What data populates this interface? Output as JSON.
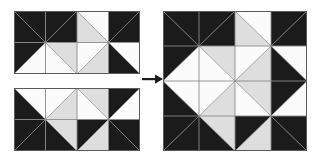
{
  "figure": {
    "background_color": "#ffffff"
  },
  "palette": {
    "dark": "#1b1b1b",
    "white": "#fbfbfb",
    "light_gray": "#dedede",
    "seam_line": "#8a8a8a",
    "border": "#5a5a5a",
    "arrow": "#1b1b1b"
  },
  "arrow": {
    "name": "transformation-arrow",
    "direction": "right",
    "label": ""
  },
  "blocks": [
    {
      "id": "top-left-unit",
      "name": "quilt-unit-top",
      "label": "",
      "x": 14,
      "y": 11,
      "width": 126,
      "height": 63,
      "cols": 4,
      "rows": 2,
      "cells": [
        {
          "r": 0,
          "c": 0,
          "diag": "tlbr",
          "a": "dark",
          "b": "dark"
        },
        {
          "r": 0,
          "c": 1,
          "diag": "trbl",
          "a": "dark",
          "b": "dark"
        },
        {
          "r": 0,
          "c": 2,
          "diag": "tlbr",
          "a": "white",
          "b": "light_gray"
        },
        {
          "r": 0,
          "c": 3,
          "diag": "trbl",
          "a": "dark",
          "b": "dark"
        },
        {
          "r": 1,
          "c": 0,
          "diag": "trbl",
          "a": "dark",
          "b": "white"
        },
        {
          "r": 1,
          "c": 1,
          "diag": "tlbr",
          "a": "light_gray",
          "b": "white"
        },
        {
          "r": 1,
          "c": 2,
          "diag": "trbl",
          "a": "white",
          "b": "light_gray"
        },
        {
          "r": 1,
          "c": 3,
          "diag": "tlbr",
          "a": "white",
          "b": "dark"
        }
      ]
    },
    {
      "id": "bottom-left-unit",
      "name": "quilt-unit-bottom",
      "label": "",
      "x": 14,
      "y": 88,
      "width": 126,
      "height": 63,
      "cols": 4,
      "rows": 2,
      "cells": [
        {
          "r": 0,
          "c": 0,
          "diag": "tlbr",
          "a": "white",
          "b": "dark"
        },
        {
          "r": 0,
          "c": 1,
          "diag": "trbl",
          "a": "white",
          "b": "light_gray"
        },
        {
          "r": 0,
          "c": 2,
          "diag": "tlbr",
          "a": "light_gray",
          "b": "white"
        },
        {
          "r": 0,
          "c": 3,
          "diag": "trbl",
          "a": "dark",
          "b": "white"
        },
        {
          "r": 1,
          "c": 0,
          "diag": "trbl",
          "a": "dark",
          "b": "dark"
        },
        {
          "r": 1,
          "c": 1,
          "diag": "tlbr",
          "a": "light_gray",
          "b": "dark"
        },
        {
          "r": 1,
          "c": 2,
          "diag": "trbl",
          "a": "dark",
          "b": "light_gray"
        },
        {
          "r": 1,
          "c": 3,
          "diag": "tlbr",
          "a": "dark",
          "b": "dark"
        }
      ]
    },
    {
      "id": "result-block",
      "name": "quilt-block-assembled",
      "label": "",
      "x": 163,
      "y": 11,
      "width": 144,
      "height": 140,
      "cols": 4,
      "rows": 4,
      "cells": [
        {
          "r": 0,
          "c": 0,
          "diag": "tlbr",
          "a": "dark",
          "b": "dark"
        },
        {
          "r": 0,
          "c": 1,
          "diag": "trbl",
          "a": "dark",
          "b": "dark"
        },
        {
          "r": 0,
          "c": 2,
          "diag": "tlbr",
          "a": "white",
          "b": "light_gray"
        },
        {
          "r": 0,
          "c": 3,
          "diag": "trbl",
          "a": "dark",
          "b": "dark"
        },
        {
          "r": 1,
          "c": 0,
          "diag": "trbl",
          "a": "dark",
          "b": "white"
        },
        {
          "r": 1,
          "c": 1,
          "diag": "tlbr",
          "a": "light_gray",
          "b": "white"
        },
        {
          "r": 1,
          "c": 2,
          "diag": "trbl",
          "a": "white",
          "b": "light_gray"
        },
        {
          "r": 1,
          "c": 3,
          "diag": "tlbr",
          "a": "white",
          "b": "dark"
        },
        {
          "r": 2,
          "c": 0,
          "diag": "tlbr",
          "a": "white",
          "b": "dark"
        },
        {
          "r": 2,
          "c": 1,
          "diag": "trbl",
          "a": "white",
          "b": "light_gray"
        },
        {
          "r": 2,
          "c": 2,
          "diag": "tlbr",
          "a": "light_gray",
          "b": "white"
        },
        {
          "r": 2,
          "c": 3,
          "diag": "trbl",
          "a": "dark",
          "b": "white"
        },
        {
          "r": 3,
          "c": 0,
          "diag": "trbl",
          "a": "dark",
          "b": "dark"
        },
        {
          "r": 3,
          "c": 1,
          "diag": "tlbr",
          "a": "light_gray",
          "b": "dark"
        },
        {
          "r": 3,
          "c": 2,
          "diag": "trbl",
          "a": "dark",
          "b": "light_gray"
        },
        {
          "r": 3,
          "c": 3,
          "diag": "tlbr",
          "a": "dark",
          "b": "dark"
        }
      ]
    }
  ]
}
